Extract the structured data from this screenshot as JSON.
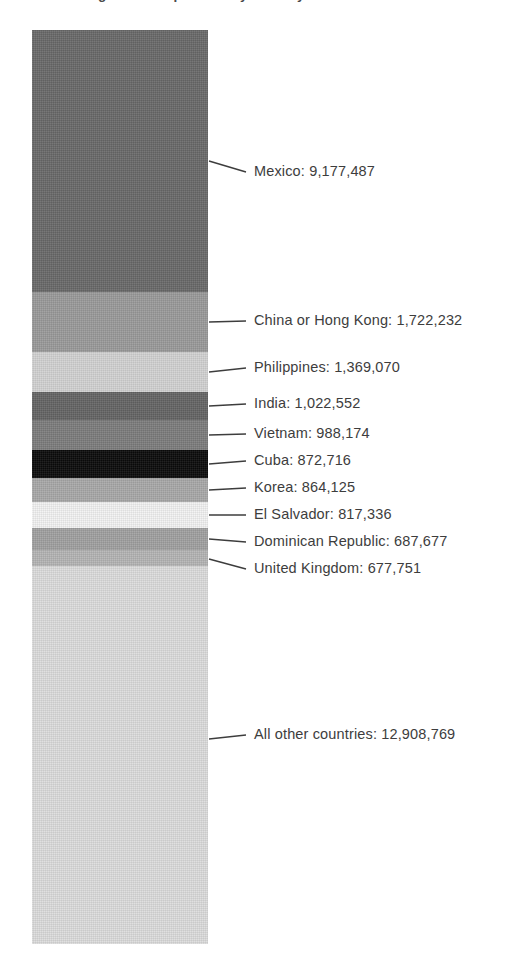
{
  "chart_title": "U.S. Foreign-Born Population by Country of Birth",
  "chart_data": {
    "type": "bar",
    "subtype": "single-stacked-bar",
    "title": "U.S. Foreign-Born Population by Country of Birth",
    "xlabel": "",
    "ylabel": "",
    "grid": false,
    "legend_position": "callout-labels-right",
    "total": 32107889,
    "categories": [
      "Mexico",
      "China or Hong Kong",
      "Philippines",
      "India",
      "Vietnam",
      "Cuba",
      "Korea",
      "El Salvador",
      "Dominican Republic",
      "United Kingdom",
      "All other countries"
    ],
    "values": [
      9177487,
      1722232,
      1369070,
      1022552,
      988174,
      872716,
      864125,
      817336,
      687677,
      677751,
      12908769
    ],
    "value_labels": [
      "9,177,487",
      "1,722,232",
      "1,369,070",
      "1,022,552",
      "988,174",
      "872,716",
      "864,125",
      "817,336",
      "687,677",
      "677,751",
      "12,908,769"
    ],
    "colors": [
      "#696969",
      "#9a9a9a",
      "#d2d2d2",
      "#646464",
      "#7c7c7c",
      "#0a0a0a",
      "#a8a8a8",
      "#f2f2f2",
      "#a0a0a0",
      "#b4b4b4",
      "#dcdcdc"
    ]
  },
  "segments": [
    {
      "name": "Mexico",
      "label": "Mexico: 9,177,487",
      "value": 9177487,
      "color": "#696969",
      "height_px": 262,
      "label_y": 175,
      "anchor_y": 161
    },
    {
      "name": "China or Hong Kong",
      "label": "China or Hong Kong: 1,722,232",
      "value": 1722232,
      "color": "#9a9a9a",
      "height_px": 60,
      "label_y": 324,
      "anchor_y": 322
    },
    {
      "name": "Philippines",
      "label": "Philippines: 1,369,070",
      "value": 1369070,
      "color": "#d2d2d2",
      "height_px": 40,
      "label_y": 371,
      "anchor_y": 372
    },
    {
      "name": "India",
      "label": "India: 1,022,552",
      "value": 1022552,
      "color": "#646464",
      "height_px": 28,
      "label_y": 407,
      "anchor_y": 406
    },
    {
      "name": "Vietnam",
      "label": "Vietnam: 988,174",
      "value": 988174,
      "color": "#7c7c7c",
      "height_px": 30,
      "label_y": 437,
      "anchor_y": 435
    },
    {
      "name": "Cuba",
      "label": "Cuba: 872,716",
      "value": 872716,
      "color": "#0a0a0a",
      "height_px": 28,
      "label_y": 464,
      "anchor_y": 464
    },
    {
      "name": "Korea",
      "label": "Korea: 864,125",
      "value": 864125,
      "color": "#a8a8a8",
      "height_px": 24,
      "label_y": 491,
      "anchor_y": 490
    },
    {
      "name": "El Salvador",
      "label": "El Salvador: 817,336",
      "value": 817336,
      "color": "#f2f2f2",
      "height_px": 26,
      "label_y": 518,
      "anchor_y": 515
    },
    {
      "name": "Dominican Republic",
      "label": "Dominican Republic: 687,677",
      "value": 687677,
      "color": "#a0a0a0",
      "height_px": 22,
      "label_y": 545,
      "anchor_y": 539
    },
    {
      "name": "United Kingdom",
      "label": "United Kingdom: 677,751",
      "value": 677751,
      "color": "#b4b4b4",
      "height_px": 16,
      "label_y": 572,
      "anchor_y": 559
    },
    {
      "name": "All other countries",
      "label": "All other countries: 12,908,769",
      "value": 12908769,
      "color": "#dcdcdc",
      "height_px": 378,
      "label_y": 738,
      "anchor_y": 739
    }
  ]
}
